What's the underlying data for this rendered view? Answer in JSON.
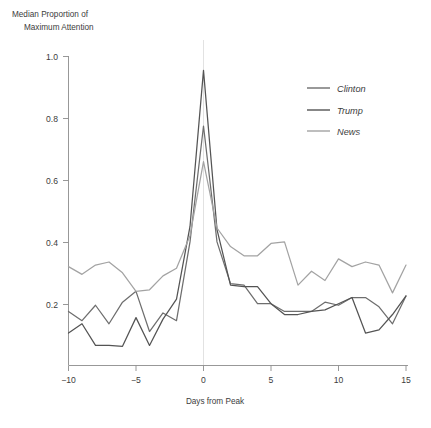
{
  "chart_data": {
    "type": "line",
    "title": "",
    "ylabel": "Median Proportion of\nMaximum Attention",
    "ylabel_line1": "Median Proportion of",
    "ylabel_line2": "Maximum Attention",
    "xlabel": "Days from Peak",
    "xlim": [
      -10,
      15
    ],
    "ylim": [
      0.0,
      1.0
    ],
    "xticks": [
      -10,
      -5,
      0,
      5,
      10,
      15
    ],
    "xticklabels": [
      "−10",
      "−5",
      "0",
      "5",
      "10",
      "15"
    ],
    "yticks": [
      0.2,
      0.4,
      0.6,
      0.8,
      1.0
    ],
    "yticklabels": [
      "0.2",
      "0.4",
      "0.6",
      "0.8",
      "1.0"
    ],
    "grid": false,
    "zero_gridline": true,
    "legend_position": "upper right",
    "x": [
      -10,
      -9,
      -8,
      -7,
      -6,
      -5,
      -4,
      -3,
      -2,
      -1,
      0,
      1,
      2,
      3,
      4,
      5,
      6,
      7,
      8,
      9,
      10,
      11,
      12,
      13,
      14,
      15
    ],
    "series": [
      {
        "name": "Clinton",
        "color": "#6e6e6e",
        "values": [
          0.175,
          0.145,
          0.195,
          0.135,
          0.205,
          0.24,
          0.11,
          0.17,
          0.145,
          0.4,
          0.775,
          0.4,
          0.265,
          0.26,
          0.2,
          0.2,
          0.175,
          0.175,
          0.175,
          0.205,
          0.195,
          0.22,
          0.22,
          0.19,
          0.135,
          0.225
        ]
      },
      {
        "name": "Trump",
        "color": "#545454",
        "values": [
          0.105,
          0.135,
          0.065,
          0.065,
          0.062,
          0.155,
          0.065,
          0.15,
          0.215,
          0.45,
          0.955,
          0.44,
          0.26,
          0.255,
          0.255,
          0.2,
          0.165,
          0.165,
          0.175,
          0.18,
          0.2,
          0.22,
          0.105,
          0.115,
          0.165,
          0.225
        ]
      },
      {
        "name": "News",
        "color": "#a3a3a3",
        "values": [
          0.32,
          0.295,
          0.325,
          0.335,
          0.3,
          0.24,
          0.245,
          0.29,
          0.315,
          0.42,
          0.66,
          0.445,
          0.385,
          0.355,
          0.355,
          0.395,
          0.4,
          0.26,
          0.305,
          0.275,
          0.345,
          0.32,
          0.335,
          0.325,
          0.235,
          0.325
        ]
      }
    ],
    "legend": [
      {
        "label": "Clinton",
        "color": "#6e6e6e"
      },
      {
        "label": "Trump",
        "color": "#545454"
      },
      {
        "label": "News",
        "color": "#a3a3a3"
      }
    ],
    "colors": {
      "background": "#ffffff",
      "axis": "#8c8c8c",
      "text": "#3c3c3c",
      "gridline": "#e2e2e2"
    }
  }
}
